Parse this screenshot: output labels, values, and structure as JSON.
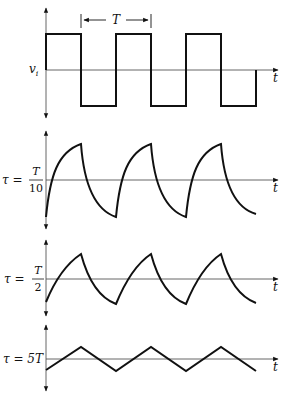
{
  "figure": {
    "panels": [
      {
        "id": "input",
        "y_label": "v",
        "y_label_sub": "i",
        "x_label": "t",
        "waveform": "square"
      },
      {
        "id": "tau_T_over_10",
        "tau_prefix": "τ =",
        "tau_num": "T",
        "tau_den": "10",
        "x_label": "t",
        "waveform": "RC output, τ = T/10"
      },
      {
        "id": "tau_T_over_2",
        "tau_prefix": "τ =",
        "tau_num": "T",
        "tau_den": "2",
        "x_label": "t",
        "waveform": "RC output, τ = T/2"
      },
      {
        "id": "tau_5T",
        "tau_label": "τ = 5T",
        "x_label": "t",
        "waveform": "RC output, τ = 5T (triangular)"
      }
    ],
    "period_marker": {
      "label": "T"
    }
  }
}
